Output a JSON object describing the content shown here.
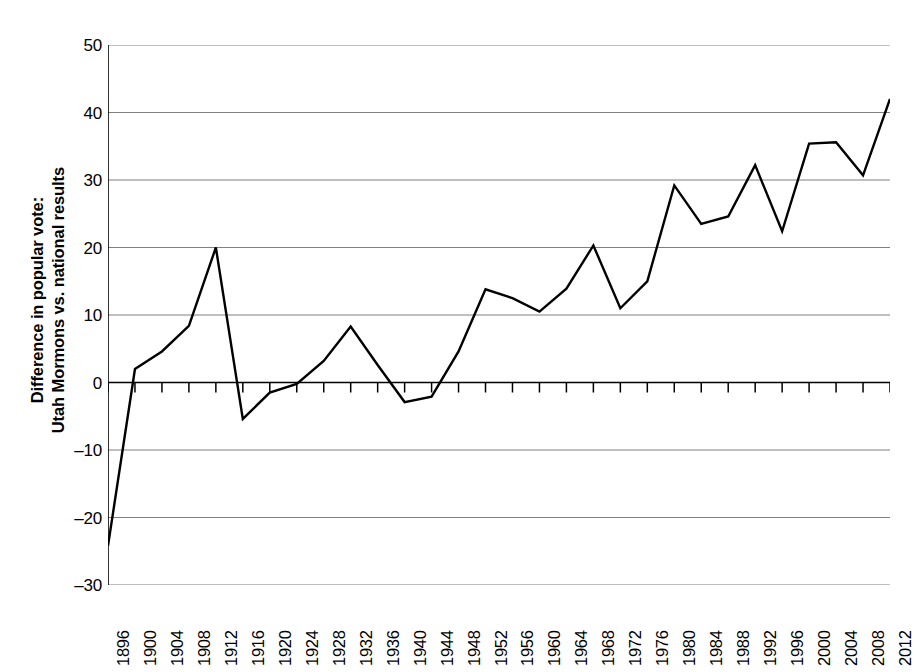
{
  "chart_data": {
    "type": "line",
    "title": "",
    "subtitle": "",
    "xlabel": "",
    "ylabel": "Difference in popular vote: Utah Mormons vs. national results",
    "ylabel_lines": [
      "Difference in popular vote:",
      "Utah Mormons vs. national results"
    ],
    "x": [
      1896,
      1900,
      1904,
      1908,
      1912,
      1916,
      1920,
      1924,
      1928,
      1932,
      1936,
      1940,
      1944,
      1948,
      1952,
      1956,
      1960,
      1964,
      1968,
      1972,
      1976,
      1980,
      1984,
      1988,
      1992,
      1996,
      2000,
      2004,
      2008,
      2012
    ],
    "categories": [
      "1896",
      "1900",
      "1904",
      "1908",
      "1912",
      "1916",
      "1920",
      "1924",
      "1928",
      "1932",
      "1936",
      "1940",
      "1944",
      "1948",
      "1952",
      "1956",
      "1960",
      "1964",
      "1968",
      "1972",
      "1976",
      "1980",
      "1984",
      "1988",
      "1992",
      "1996",
      "2000",
      "2004",
      "2008",
      "2012"
    ],
    "values": [
      -24.2,
      2.0,
      4.6,
      8.4,
      20.0,
      -5.4,
      -1.5,
      -0.2,
      3.2,
      8.3,
      2.6,
      -2.9,
      -2.1,
      4.6,
      13.8,
      12.5,
      10.5,
      13.9,
      20.3,
      11.0,
      15.0,
      29.2,
      23.5,
      24.6,
      32.2,
      22.4,
      35.4,
      35.6,
      30.7,
      42.0
    ],
    "series": [
      {
        "name": "Difference in popular vote",
        "values": [
          -24.2,
          2.0,
          4.6,
          8.4,
          20.0,
          -5.4,
          -1.5,
          -0.2,
          3.2,
          8.3,
          2.6,
          -2.9,
          -2.1,
          4.6,
          13.8,
          12.5,
          10.5,
          13.9,
          20.3,
          11.0,
          15.0,
          29.2,
          23.5,
          24.6,
          32.2,
          22.4,
          35.4,
          35.6,
          30.7,
          42.0
        ],
        "color": "#000000"
      }
    ],
    "ylim": [
      -30,
      50
    ],
    "yticks": [
      50,
      40,
      30,
      20,
      10,
      0,
      -10,
      -20,
      -30
    ],
    "ytick_labels": [
      "50",
      "40",
      "30",
      "20",
      "10",
      "0",
      "–10",
      "–20",
      "–30"
    ],
    "xlim": [
      1896,
      2012
    ],
    "grid": "horizontal",
    "legend": "none",
    "line_color": "#000000",
    "gridline_color": "#808080",
    "axis_color": "#000000",
    "background": "#ffffff",
    "markers": "none"
  }
}
